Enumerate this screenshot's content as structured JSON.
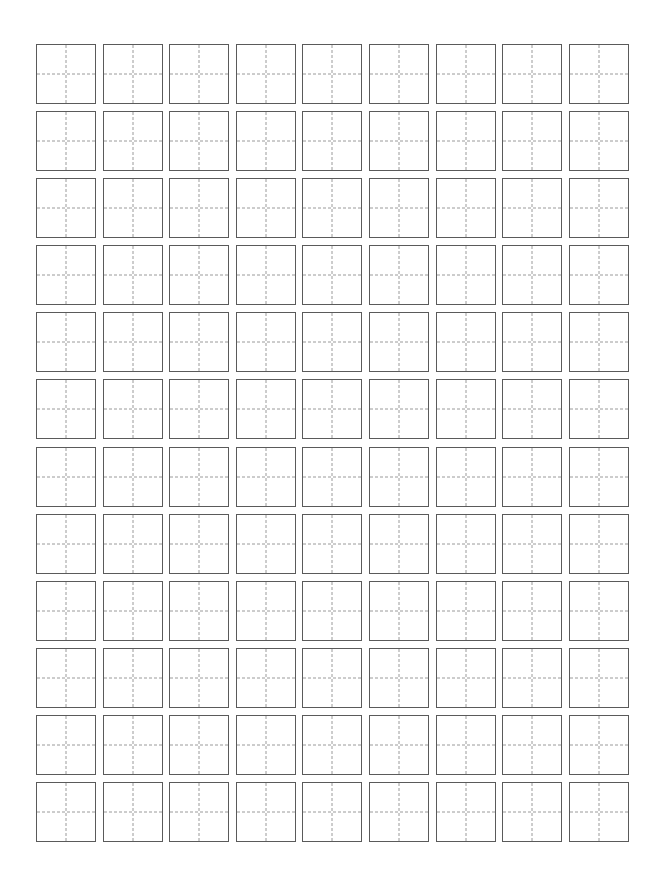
{
  "page": {
    "sheet_type": "tian-zi-ge",
    "background_color": "#ffffff",
    "width_px": 664,
    "height_px": 893
  },
  "grid": {
    "columns": 9,
    "rows": 12,
    "total_cells": 108,
    "cell_width_px": 60,
    "cell_height_px": 60,
    "column_gap_px": 6.6,
    "row_gap_px": 7.1,
    "origin_left_px": 36,
    "origin_top_px": 44,
    "border_color": "#5a5a5a",
    "border_width_px": 1.6,
    "guide_color": "#9a9a9a",
    "guide_style": "dashed",
    "guide_width_px": 1.4,
    "cell_fill_color": "#ffffff",
    "cells": [
      {
        "row": 1,
        "col": 1,
        "text": ""
      },
      {
        "row": 1,
        "col": 2,
        "text": ""
      },
      {
        "row": 1,
        "col": 3,
        "text": ""
      },
      {
        "row": 1,
        "col": 4,
        "text": ""
      },
      {
        "row": 1,
        "col": 5,
        "text": ""
      },
      {
        "row": 1,
        "col": 6,
        "text": ""
      },
      {
        "row": 1,
        "col": 7,
        "text": ""
      },
      {
        "row": 1,
        "col": 8,
        "text": ""
      },
      {
        "row": 1,
        "col": 9,
        "text": ""
      },
      {
        "row": 2,
        "col": 1,
        "text": ""
      },
      {
        "row": 2,
        "col": 2,
        "text": ""
      },
      {
        "row": 2,
        "col": 3,
        "text": ""
      },
      {
        "row": 2,
        "col": 4,
        "text": ""
      },
      {
        "row": 2,
        "col": 5,
        "text": ""
      },
      {
        "row": 2,
        "col": 6,
        "text": ""
      },
      {
        "row": 2,
        "col": 7,
        "text": ""
      },
      {
        "row": 2,
        "col": 8,
        "text": ""
      },
      {
        "row": 2,
        "col": 9,
        "text": ""
      },
      {
        "row": 3,
        "col": 1,
        "text": ""
      },
      {
        "row": 3,
        "col": 2,
        "text": ""
      },
      {
        "row": 3,
        "col": 3,
        "text": ""
      },
      {
        "row": 3,
        "col": 4,
        "text": ""
      },
      {
        "row": 3,
        "col": 5,
        "text": ""
      },
      {
        "row": 3,
        "col": 6,
        "text": ""
      },
      {
        "row": 3,
        "col": 7,
        "text": ""
      },
      {
        "row": 3,
        "col": 8,
        "text": ""
      },
      {
        "row": 3,
        "col": 9,
        "text": ""
      },
      {
        "row": 4,
        "col": 1,
        "text": ""
      },
      {
        "row": 4,
        "col": 2,
        "text": ""
      },
      {
        "row": 4,
        "col": 3,
        "text": ""
      },
      {
        "row": 4,
        "col": 4,
        "text": ""
      },
      {
        "row": 4,
        "col": 5,
        "text": ""
      },
      {
        "row": 4,
        "col": 6,
        "text": ""
      },
      {
        "row": 4,
        "col": 7,
        "text": ""
      },
      {
        "row": 4,
        "col": 8,
        "text": ""
      },
      {
        "row": 4,
        "col": 9,
        "text": ""
      },
      {
        "row": 5,
        "col": 1,
        "text": ""
      },
      {
        "row": 5,
        "col": 2,
        "text": ""
      },
      {
        "row": 5,
        "col": 3,
        "text": ""
      },
      {
        "row": 5,
        "col": 4,
        "text": ""
      },
      {
        "row": 5,
        "col": 5,
        "text": ""
      },
      {
        "row": 5,
        "col": 6,
        "text": ""
      },
      {
        "row": 5,
        "col": 7,
        "text": ""
      },
      {
        "row": 5,
        "col": 8,
        "text": ""
      },
      {
        "row": 5,
        "col": 9,
        "text": ""
      },
      {
        "row": 6,
        "col": 1,
        "text": ""
      },
      {
        "row": 6,
        "col": 2,
        "text": ""
      },
      {
        "row": 6,
        "col": 3,
        "text": ""
      },
      {
        "row": 6,
        "col": 4,
        "text": ""
      },
      {
        "row": 6,
        "col": 5,
        "text": ""
      },
      {
        "row": 6,
        "col": 6,
        "text": ""
      },
      {
        "row": 6,
        "col": 7,
        "text": ""
      },
      {
        "row": 6,
        "col": 8,
        "text": ""
      },
      {
        "row": 6,
        "col": 9,
        "text": ""
      },
      {
        "row": 7,
        "col": 1,
        "text": ""
      },
      {
        "row": 7,
        "col": 2,
        "text": ""
      },
      {
        "row": 7,
        "col": 3,
        "text": ""
      },
      {
        "row": 7,
        "col": 4,
        "text": ""
      },
      {
        "row": 7,
        "col": 5,
        "text": ""
      },
      {
        "row": 7,
        "col": 6,
        "text": ""
      },
      {
        "row": 7,
        "col": 7,
        "text": ""
      },
      {
        "row": 7,
        "col": 8,
        "text": ""
      },
      {
        "row": 7,
        "col": 9,
        "text": ""
      },
      {
        "row": 8,
        "col": 1,
        "text": ""
      },
      {
        "row": 8,
        "col": 2,
        "text": ""
      },
      {
        "row": 8,
        "col": 3,
        "text": ""
      },
      {
        "row": 8,
        "col": 4,
        "text": ""
      },
      {
        "row": 8,
        "col": 5,
        "text": ""
      },
      {
        "row": 8,
        "col": 6,
        "text": ""
      },
      {
        "row": 8,
        "col": 7,
        "text": ""
      },
      {
        "row": 8,
        "col": 8,
        "text": ""
      },
      {
        "row": 8,
        "col": 9,
        "text": ""
      },
      {
        "row": 9,
        "col": 1,
        "text": ""
      },
      {
        "row": 9,
        "col": 2,
        "text": ""
      },
      {
        "row": 9,
        "col": 3,
        "text": ""
      },
      {
        "row": 9,
        "col": 4,
        "text": ""
      },
      {
        "row": 9,
        "col": 5,
        "text": ""
      },
      {
        "row": 9,
        "col": 6,
        "text": ""
      },
      {
        "row": 9,
        "col": 7,
        "text": ""
      },
      {
        "row": 9,
        "col": 8,
        "text": ""
      },
      {
        "row": 9,
        "col": 9,
        "text": ""
      },
      {
        "row": 10,
        "col": 1,
        "text": ""
      },
      {
        "row": 10,
        "col": 2,
        "text": ""
      },
      {
        "row": 10,
        "col": 3,
        "text": ""
      },
      {
        "row": 10,
        "col": 4,
        "text": ""
      },
      {
        "row": 10,
        "col": 5,
        "text": ""
      },
      {
        "row": 10,
        "col": 6,
        "text": ""
      },
      {
        "row": 10,
        "col": 7,
        "text": ""
      },
      {
        "row": 10,
        "col": 8,
        "text": ""
      },
      {
        "row": 10,
        "col": 9,
        "text": ""
      },
      {
        "row": 11,
        "col": 1,
        "text": ""
      },
      {
        "row": 11,
        "col": 2,
        "text": ""
      },
      {
        "row": 11,
        "col": 3,
        "text": ""
      },
      {
        "row": 11,
        "col": 4,
        "text": ""
      },
      {
        "row": 11,
        "col": 5,
        "text": ""
      },
      {
        "row": 11,
        "col": 6,
        "text": ""
      },
      {
        "row": 11,
        "col": 7,
        "text": ""
      },
      {
        "row": 11,
        "col": 8,
        "text": ""
      },
      {
        "row": 11,
        "col": 9,
        "text": ""
      },
      {
        "row": 12,
        "col": 1,
        "text": ""
      },
      {
        "row": 12,
        "col": 2,
        "text": ""
      },
      {
        "row": 12,
        "col": 3,
        "text": ""
      },
      {
        "row": 12,
        "col": 4,
        "text": ""
      },
      {
        "row": 12,
        "col": 5,
        "text": ""
      },
      {
        "row": 12,
        "col": 6,
        "text": ""
      },
      {
        "row": 12,
        "col": 7,
        "text": ""
      },
      {
        "row": 12,
        "col": 8,
        "text": ""
      },
      {
        "row": 12,
        "col": 9,
        "text": ""
      }
    ]
  }
}
